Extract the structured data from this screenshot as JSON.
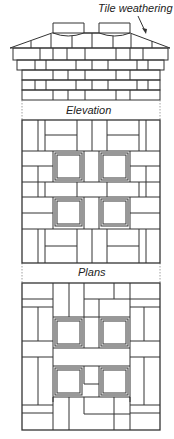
{
  "diagram": {
    "annotations": {
      "tile_weathering": "Tile weathering",
      "elevation": "Elevation",
      "plans": "Plans"
    },
    "colors": {
      "line": "#333333",
      "background": "#ffffff"
    }
  }
}
